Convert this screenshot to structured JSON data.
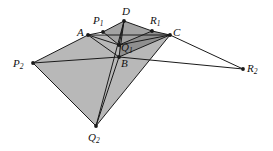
{
  "figure": {
    "width": 273,
    "height": 151,
    "background": "#ffffff",
    "stroke_color": "#1a1a1a",
    "fill_light": "#b8b8b8",
    "fill_dark": "#a3a3a3",
    "fill_darker": "#8f8f8f",
    "point_radius": 1.9,
    "line_width": 1.0
  },
  "points": {
    "A": {
      "label": "A",
      "sub": "",
      "x": 88,
      "y": 35,
      "lx": 77,
      "ly": 27
    },
    "B": {
      "label": "B",
      "sub": "",
      "x": 119,
      "y": 57,
      "lx": 121,
      "ly": 58
    },
    "C": {
      "label": "C",
      "sub": "",
      "x": 170,
      "y": 35,
      "lx": 173,
      "ly": 27
    },
    "D": {
      "label": "D",
      "sub": "",
      "x": 124,
      "y": 21,
      "lx": 122,
      "ly": 6
    },
    "P1": {
      "label": "P",
      "sub": "1",
      "x": 103,
      "y": 32,
      "lx": 93,
      "ly": 15
    },
    "R1": {
      "label": "R",
      "sub": "1",
      "x": 152,
      "y": 31,
      "lx": 150,
      "ly": 15
    },
    "Q1": {
      "label": "Q",
      "sub": "1",
      "x": 119,
      "y": 45,
      "lx": 121,
      "ly": 42
    },
    "P2": {
      "label": "P",
      "sub": "2",
      "x": 33,
      "y": 63,
      "lx": 13,
      "ly": 58
    },
    "R2": {
      "label": "R",
      "sub": "2",
      "x": 243,
      "y": 69,
      "lx": 247,
      "ly": 63
    },
    "Q2": {
      "label": "Q",
      "sub": "2",
      "x": 96,
      "y": 126,
      "lx": 88,
      "ly": 132
    }
  },
  "shaded_regions": [
    {
      "name": "outer-shaded-quad",
      "vertices": [
        "P2",
        "A",
        "C",
        "Q2"
      ],
      "fill": "#b8b8b8"
    },
    {
      "name": "inner-shaded-quad",
      "vertices": [
        "P1",
        "D",
        "R1",
        "Q1"
      ],
      "fill": "#a3a3a3"
    },
    {
      "name": "overlap-wedge",
      "vertices": [
        "Q1",
        "R1",
        "C",
        "B"
      ],
      "fill": "#8f8f8f"
    }
  ],
  "segments": [
    {
      "name": "P2-A",
      "from": "P2",
      "to": "A"
    },
    {
      "name": "A-P1",
      "from": "A",
      "to": "P1"
    },
    {
      "name": "P1-D",
      "from": "P1",
      "to": "D"
    },
    {
      "name": "D-R1",
      "from": "D",
      "to": "R1"
    },
    {
      "name": "R1-C",
      "from": "R1",
      "to": "C"
    },
    {
      "name": "C-R2",
      "from": "C",
      "to": "R2"
    },
    {
      "name": "A-C",
      "from": "A",
      "to": "C"
    },
    {
      "name": "A-Q1",
      "from": "A",
      "to": "Q1"
    },
    {
      "name": "Q1-C",
      "from": "Q1",
      "to": "C"
    },
    {
      "name": "P1-Q1",
      "from": "P1",
      "to": "Q1"
    },
    {
      "name": "R1-Q1",
      "from": "R1",
      "to": "Q1"
    },
    {
      "name": "D-Q1",
      "from": "D",
      "to": "Q1"
    },
    {
      "name": "D-B",
      "from": "D",
      "to": "B"
    },
    {
      "name": "A-B",
      "from": "A",
      "to": "B"
    },
    {
      "name": "B-C",
      "from": "B",
      "to": "C"
    },
    {
      "name": "P2-B",
      "from": "P2",
      "to": "B"
    },
    {
      "name": "B-R2",
      "from": "B",
      "to": "R2"
    },
    {
      "name": "B-Q2",
      "from": "B",
      "to": "Q2"
    },
    {
      "name": "D-Q2",
      "from": "D",
      "to": "Q2"
    },
    {
      "name": "P2-Q2",
      "from": "P2",
      "to": "Q2"
    },
    {
      "name": "Q2-C",
      "from": "Q2",
      "to": "C"
    }
  ]
}
